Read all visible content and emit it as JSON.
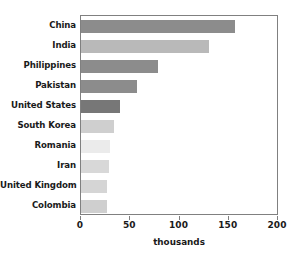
{
  "chart_data": {
    "type": "bar",
    "orientation": "horizontal",
    "title": "",
    "xlabel": "thousands",
    "ylabel": "",
    "xlim": [
      0,
      200
    ],
    "xticks": [
      0,
      50,
      100,
      150,
      200
    ],
    "xtick_labels": [
      "0",
      "50",
      "100",
      "150",
      "200"
    ],
    "grid": false,
    "legend": false,
    "categories": [
      "China",
      "India",
      "Philippines",
      "Pakistan",
      "United States",
      "South Korea",
      "Romania",
      "Iran",
      "United Kingdom",
      "Colombia"
    ],
    "values": [
      156,
      130,
      78,
      57,
      40,
      33,
      29,
      28,
      26,
      26
    ],
    "bar_colors": [
      "#8c8c8c",
      "#b9b9b9",
      "#8c8c8c",
      "#8c8c8c",
      "#777777",
      "#cfcfcf",
      "#ebebeb",
      "#d8d8d8",
      "#d5d5d5",
      "#cfcfcf"
    ]
  },
  "style": {
    "frame_color": "#808080",
    "text_color": "#1a1a1a",
    "background": "#ffffff"
  }
}
